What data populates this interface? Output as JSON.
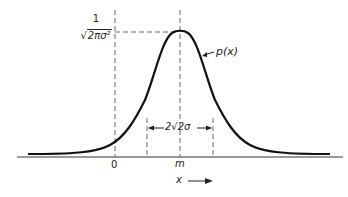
{
  "figure": {
    "peak_label_numerator": "1",
    "peak_label_radical": "√",
    "peak_label_denominator": "2πσ²",
    "curve_label": "p(x)",
    "width_label": "2√2σ",
    "origin_label": "0",
    "mean_label": "m",
    "axis_label": "x",
    "axis_arrow": "⟶"
  },
  "colors": {
    "curve": "#111111",
    "axis": "#333333",
    "dashed": "#666666",
    "background": "#ffffff"
  }
}
